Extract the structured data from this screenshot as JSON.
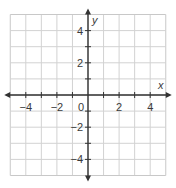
{
  "chart_data": {
    "type": "coordinate-plane",
    "title": "",
    "xlabel": "x",
    "ylabel": "y",
    "xlim": [
      -5,
      5
    ],
    "ylim": [
      -5,
      5
    ],
    "grid": true,
    "grid_step": 1,
    "x_tick_labels": [
      "−4",
      "−2",
      "0",
      "2",
      "4"
    ],
    "x_tick_values": [
      -4,
      -2,
      0,
      2,
      4
    ],
    "y_tick_labels": [
      "4",
      "2",
      "−2",
      "−4"
    ],
    "y_tick_values": [
      4,
      2,
      -2,
      -4
    ],
    "series": [],
    "colors": {
      "grid": "#d2d2d2",
      "border": "#c8c8c8",
      "axis": "#333333",
      "text": "#3a3a3a"
    }
  }
}
